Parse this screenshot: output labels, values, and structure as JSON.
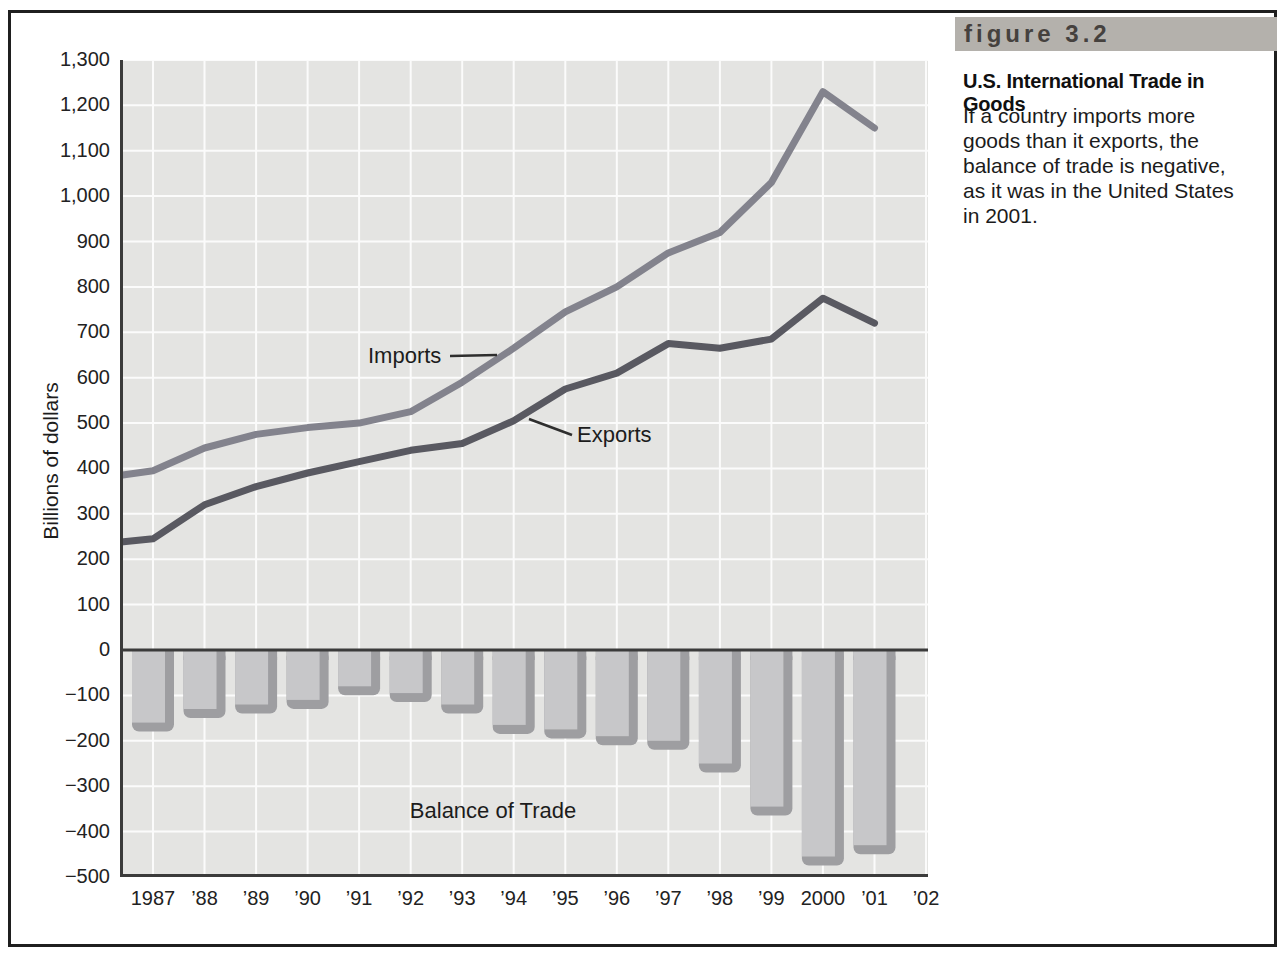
{
  "figure": {
    "label": "figure 3.2",
    "title": "U.S. International Trade in Goods",
    "caption_lines": [
      "If a country imports more",
      "goods than it exports, the",
      "balance of trade is negative,",
      "as it was in the United States",
      "in 2001."
    ]
  },
  "chart_data": {
    "type": "line+bar",
    "title": "",
    "ylabel": "Billions of dollars",
    "xlabel": "",
    "ylim": [
      -500,
      1300
    ],
    "ytick_step": 100,
    "grid": true,
    "y_tick_labels": [
      "1,300",
      "1,200",
      "1,100",
      "1,000",
      "900",
      "800",
      "700",
      "600",
      "500",
      "400",
      "300",
      "200",
      "100",
      "0",
      "−100",
      "−200",
      "−300",
      "−400",
      "−500"
    ],
    "x_labels": [
      "1987",
      "’88",
      "’89",
      "’90",
      "’91",
      "’92",
      "’93",
      "’94",
      "’95",
      "’96",
      "’97",
      "’98",
      "’99",
      "2000",
      "’01",
      "’02"
    ],
    "series": [
      {
        "name": "Imports",
        "type": "line",
        "color": "#83838d",
        "axis_start": 385,
        "values": [
          395,
          445,
          475,
          490,
          500,
          525,
          590,
          665,
          745,
          800,
          875,
          920,
          1030,
          1230,
          1150
        ]
      },
      {
        "name": "Exports",
        "type": "line",
        "color": "#595961",
        "axis_start": 238,
        "values": [
          245,
          320,
          360,
          390,
          415,
          440,
          455,
          505,
          575,
          610,
          675,
          665,
          685,
          775,
          720
        ]
      }
    ],
    "bars": {
      "name": "Balance of Trade",
      "face_color": "#c7c7c9",
      "shadow_color": "#9e9ea1",
      "values": [
        -160,
        -130,
        -120,
        -110,
        -80,
        -95,
        -120,
        -165,
        -175,
        -190,
        -200,
        -250,
        -345,
        -455,
        -430
      ]
    },
    "annotations": {
      "imports": "Imports",
      "exports": "Exports",
      "balance": "Balance of Trade"
    },
    "colors": {
      "plot_bg": "#e4e4e2",
      "grid": "#fbfbfb",
      "axis": "#3b3b3b",
      "leader": "#2e2e2e"
    }
  }
}
